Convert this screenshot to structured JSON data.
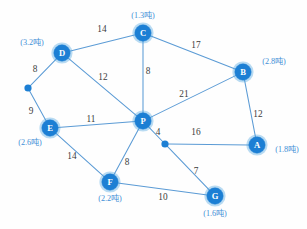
{
  "chart_data": {
    "type": "diagram",
    "diagram_kind": "weighted-undirected-graph",
    "title": "",
    "unit": "吨",
    "nodes": [
      {
        "id": "C",
        "label": "C",
        "tonnage": "(1.3吨)",
        "x": 143,
        "y": 33,
        "r": 8.2,
        "kind": "depot",
        "tonnage_x": 143,
        "tonnage_y": 16
      },
      {
        "id": "D",
        "label": "D",
        "tonnage": "(3.2吨)",
        "x": 62,
        "y": 53,
        "r": 8.2,
        "kind": "depot",
        "tonnage_x": 32,
        "tonnage_y": 43
      },
      {
        "id": "B",
        "label": "B",
        "tonnage": "(2.8吨)",
        "x": 243,
        "y": 72,
        "r": 8.2,
        "kind": "depot",
        "tonnage_x": 274,
        "tonnage_y": 62
      },
      {
        "id": "E",
        "label": "E",
        "tonnage": "(2.6吨)",
        "x": 50,
        "y": 128,
        "r": 8.2,
        "kind": "depot",
        "tonnage_x": 30,
        "tonnage_y": 143
      },
      {
        "id": "P",
        "label": "P",
        "tonnage": "",
        "x": 143,
        "y": 121,
        "r": 8.2,
        "kind": "hub",
        "tonnage_x": 0,
        "tonnage_y": 0
      },
      {
        "id": "A",
        "label": "A",
        "tonnage": "(1.8吨)",
        "x": 257,
        "y": 145,
        "r": 8.2,
        "kind": "depot",
        "tonnage_x": 287,
        "tonnage_y": 150
      },
      {
        "id": "F",
        "label": "F",
        "tonnage": "(2.2吨)",
        "x": 110,
        "y": 182,
        "r": 8.2,
        "kind": "depot",
        "tonnage_x": 110,
        "tonnage_y": 199
      },
      {
        "id": "G",
        "label": "G",
        "tonnage": "(1.6吨)",
        "x": 215,
        "y": 196,
        "r": 8.2,
        "kind": "depot",
        "tonnage_x": 215,
        "tonnage_y": 214
      },
      {
        "id": "W1",
        "label": "",
        "tonnage": "",
        "x": 28,
        "y": 88,
        "r": 3.6,
        "kind": "waypoint",
        "tonnage_x": 0,
        "tonnage_y": 0
      },
      {
        "id": "W2",
        "label": "",
        "tonnage": "",
        "x": 165,
        "y": 144,
        "r": 3.6,
        "kind": "waypoint",
        "tonnage_x": 0,
        "tonnage_y": 0
      }
    ],
    "edges": [
      {
        "from": "D",
        "to": "C",
        "weight": "14",
        "label_x": 102,
        "label_y": 30
      },
      {
        "from": "C",
        "to": "B",
        "weight": "17",
        "label_x": 196,
        "label_y": 46
      },
      {
        "from": "D",
        "to": "P",
        "weight": "12",
        "label_x": 103,
        "label_y": 78
      },
      {
        "from": "C",
        "to": "P",
        "weight": "8",
        "label_x": 148,
        "label_y": 72
      },
      {
        "from": "P",
        "to": "B",
        "weight": "21",
        "label_x": 184,
        "label_y": 95
      },
      {
        "from": "B",
        "to": "A",
        "weight": "12",
        "label_x": 258,
        "label_y": 115
      },
      {
        "from": "D",
        "to": "W1",
        "weight": "8",
        "label_x": 35,
        "label_y": 70
      },
      {
        "from": "W1",
        "to": "E",
        "weight": "9",
        "label_x": 31,
        "label_y": 112
      },
      {
        "from": "E",
        "to": "P",
        "weight": "11",
        "label_x": 91,
        "label_y": 120
      },
      {
        "from": "P",
        "to": "W2",
        "weight": "4",
        "label_x": 158,
        "label_y": 133
      },
      {
        "from": "W2",
        "to": "A",
        "weight": "16",
        "label_x": 196,
        "label_y": 133
      },
      {
        "from": "E",
        "to": "F",
        "weight": "14",
        "label_x": 72,
        "label_y": 157
      },
      {
        "from": "F",
        "to": "P",
        "weight": "8",
        "label_x": 127,
        "label_y": 163
      },
      {
        "from": "W2",
        "to": "G",
        "weight": "7",
        "label_x": 196,
        "label_y": 172
      },
      {
        "from": "F",
        "to": "G",
        "weight": "10",
        "label_x": 163,
        "label_y": 198
      }
    ],
    "colors": {
      "node_fill": "#1c7fd4",
      "edge_stroke": "#5b9bd5",
      "weight_text": "#3b3b3b",
      "tonnage_text": "#3f8fd6",
      "background": "#fefefe"
    }
  }
}
